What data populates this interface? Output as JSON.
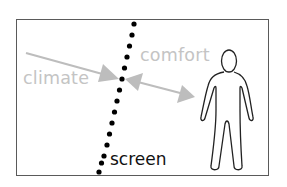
{
  "diagram": {
    "labels": {
      "climate": "climate",
      "comfort": "comfort",
      "screen": "screen"
    },
    "elements": [
      {
        "id": "frame",
        "type": "rectangle-border"
      },
      {
        "id": "screen-line",
        "type": "dotted-line",
        "label": "screen"
      },
      {
        "id": "climate-arrow",
        "type": "arrow",
        "direction": "one-way",
        "from": "climate",
        "to": "screen",
        "label": "climate"
      },
      {
        "id": "comfort-arrow",
        "type": "arrow",
        "direction": "two-way",
        "from": "screen",
        "to": "person",
        "label": "comfort"
      },
      {
        "id": "person",
        "type": "human-figure-outline"
      }
    ],
    "colors": {
      "frame": "#5a5a5a",
      "arrows": "#bdbdbd",
      "arrow_labels": "#c4c4c4",
      "screen_dots": "#000000",
      "screen_label": "#111111",
      "person_outline": "#222222",
      "background": "#ffffff"
    }
  }
}
